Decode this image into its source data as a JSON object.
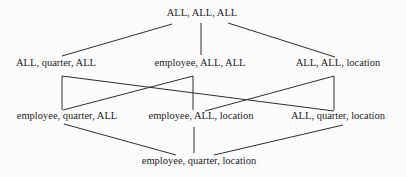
{
  "diagram": {
    "type": "lattice",
    "nodes": [
      {
        "id": "all-all-all",
        "label": "ALL, ALL, ALL"
      },
      {
        "id": "all-quarter-all",
        "label": "ALL, quarter, ALL"
      },
      {
        "id": "employee-all-all",
        "label": "employee, ALL, ALL"
      },
      {
        "id": "all-all-location",
        "label": "ALL, ALL, location"
      },
      {
        "id": "employee-quarter-all",
        "label": "employee, quarter, ALL"
      },
      {
        "id": "employee-all-location",
        "label": "employee, ALL, location"
      },
      {
        "id": "all-quarter-location",
        "label": "ALL, quarter, location"
      },
      {
        "id": "employee-quarter-location",
        "label": "employee, quarter, location"
      }
    ],
    "edges": [
      {
        "from": "all-all-all",
        "to": "all-quarter-all"
      },
      {
        "from": "all-all-all",
        "to": "employee-all-all"
      },
      {
        "from": "all-all-all",
        "to": "all-all-location"
      },
      {
        "from": "all-quarter-all",
        "to": "employee-quarter-all"
      },
      {
        "from": "all-quarter-all",
        "to": "all-quarter-location"
      },
      {
        "from": "employee-all-all",
        "to": "employee-quarter-all"
      },
      {
        "from": "employee-all-all",
        "to": "employee-all-location"
      },
      {
        "from": "all-all-location",
        "to": "employee-all-location"
      },
      {
        "from": "all-all-location",
        "to": "all-quarter-location"
      },
      {
        "from": "employee-quarter-all",
        "to": "employee-quarter-location"
      },
      {
        "from": "employee-all-location",
        "to": "employee-quarter-location"
      },
      {
        "from": "all-quarter-location",
        "to": "employee-quarter-location"
      }
    ],
    "colors": {
      "background": "#fcfcfc",
      "text": "#1c1c1c",
      "line": "#2e2e2e"
    }
  }
}
